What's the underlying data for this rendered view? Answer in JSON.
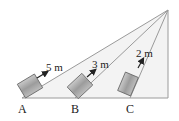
{
  "diagram": {
    "points": [
      {
        "label": "A"
      },
      {
        "label": "B"
      },
      {
        "label": "C"
      }
    ],
    "distances": [
      {
        "label": "5 m"
      },
      {
        "label": "3 m"
      },
      {
        "label": "2 m"
      }
    ],
    "colors": {
      "line": "#9a9a9a",
      "fill": "#f2f2f2",
      "block": "#a8a8a8",
      "arrow": "#222222"
    }
  }
}
